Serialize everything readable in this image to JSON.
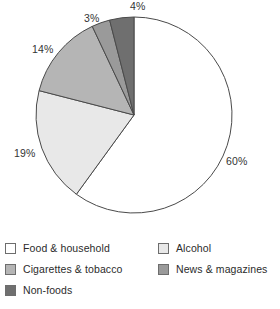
{
  "chart_data": {
    "type": "pie",
    "title": "",
    "subtitle": "",
    "xlabel": "",
    "ylabel": "",
    "grid": false,
    "legend_position": "bottom",
    "start_angle_deg": 0,
    "direction": "clockwise",
    "categories": [
      "Food & household",
      "Alcohol",
      "Cigarettes & tobacco",
      "News & magazines",
      "Non-foods"
    ],
    "values": [
      60,
      19,
      14,
      3,
      4
    ],
    "value_labels": [
      "60%",
      "19%",
      "14%",
      "3%",
      "4%"
    ],
    "colors": [
      "#ffffff",
      "#e8e8e8",
      "#b5b5b5",
      "#9a9a9a",
      "#6f6f6f"
    ],
    "slices": [
      {
        "label": "Food & household",
        "value": 60,
        "value_label": "60%",
        "color": "#ffffff",
        "start_deg": 0,
        "end_deg": 216
      },
      {
        "label": "Alcohol",
        "value": 19,
        "value_label": "19%",
        "color": "#e8e8e8",
        "start_deg": 216,
        "end_deg": 284.4
      },
      {
        "label": "Cigarettes & tobacco",
        "value": 14,
        "value_label": "14%",
        "color": "#b5b5b5",
        "start_deg": 284.4,
        "end_deg": 334.8
      },
      {
        "label": "News & magazines",
        "value": 3,
        "value_label": "3%",
        "color": "#9a9a9a",
        "start_deg": 334.8,
        "end_deg": 345.6
      },
      {
        "label": "Non-foods",
        "value": 4,
        "value_label": "4%",
        "color": "#6f6f6f",
        "start_deg": 345.6,
        "end_deg": 360
      }
    ],
    "geometry": {
      "cx": 134,
      "cy": 115,
      "r": 98,
      "outline_color": "#4a4a4a"
    },
    "label_positions": [
      {
        "text": "60%",
        "left": 226,
        "top": 156
      },
      {
        "text": "19%",
        "left": 14,
        "top": 148
      },
      {
        "text": "14%",
        "left": 32,
        "top": 44
      },
      {
        "text": "3%",
        "left": 84,
        "top": 13
      },
      {
        "text": "4%",
        "left": 130,
        "top": 1
      }
    ]
  },
  "legend": {
    "columns": [
      {
        "name": "left-column",
        "items": [
          {
            "label": "Food & household",
            "color": "#ffffff"
          },
          {
            "label": "Cigarettes & tobacco",
            "color": "#b5b5b5"
          },
          {
            "label": "Non-foods",
            "color": "#6f6f6f"
          }
        ]
      },
      {
        "name": "right-column",
        "items": [
          {
            "label": "Alcohol",
            "color": "#e8e8e8"
          },
          {
            "label": "News & magazines",
            "color": "#9a9a9a"
          }
        ]
      }
    ]
  }
}
